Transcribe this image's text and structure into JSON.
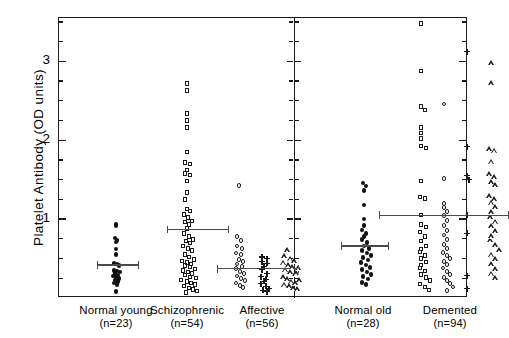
{
  "chart_data": {
    "type": "scatter",
    "title": "",
    "xlabel": "",
    "ylabel": "Platelet Antibody (OD units)",
    "ylim": [
      0,
      3.55
    ],
    "yticks_major": [
      1,
      2,
      3
    ],
    "ytick_labels": [
      "1",
      "2",
      "3"
    ],
    "yticks_minor": [
      0.25,
      0.5,
      0.75,
      1.25,
      1.5,
      1.75,
      2.25,
      2.5,
      2.75,
      3.25,
      3.5
    ],
    "grid": false,
    "legend": "none",
    "panels": [
      {
        "name": "left-panel",
        "groups": [
          {
            "label": "Normal young",
            "n_label": "(n=23)",
            "n": 23,
            "marker": "filled-circle",
            "mean": 0.42,
            "err_low": 0.21,
            "err_high": 0.63,
            "columns": [
              {
                "marker": "filled-circle",
                "values": [
                  0.93,
                  0.92,
                  0.76,
                  0.73,
                  0.71,
                  0.62,
                  0.55,
                  0.44,
                  0.43,
                  0.41,
                  0.35,
                  0.34,
                  0.33,
                  0.31,
                  0.29,
                  0.28,
                  0.26,
                  0.25,
                  0.23,
                  0.21,
                  0.19,
                  0.17,
                  0.08
                ],
                "offsets": [
                  0,
                  0,
                  -1,
                  1,
                  0,
                  0,
                  0,
                  -2,
                  1,
                  3,
                  -2,
                  1,
                  4,
                  -1,
                  2,
                  -3,
                  0,
                  3,
                  -1,
                  2,
                  -2,
                  1,
                  0
                ]
              }
            ]
          },
          {
            "label": "Schizophrenic",
            "n_label": "(n=54)",
            "n": 54,
            "marker": "open-square",
            "mean": 0.87,
            "err_low": 0.68,
            "err_high": 1.06,
            "columns": [
              {
                "marker": "open-square",
                "values": [
                  2.72,
                  2.63,
                  2.34,
                  2.25,
                  2.16,
                  1.85,
                  1.72,
                  1.7,
                  1.62,
                  1.58,
                  1.56,
                  1.48,
                  1.34,
                  1.25,
                  1.13,
                  1.1,
                  1.06,
                  1.02,
                  0.98,
                  0.96,
                  0.93,
                  0.88,
                  0.82,
                  0.78,
                  0.74,
                  0.72,
                  0.7,
                  0.66,
                  0.63,
                  0.6,
                  0.55,
                  0.52,
                  0.49,
                  0.47,
                  0.45,
                  0.43,
                  0.41,
                  0.39,
                  0.37,
                  0.35,
                  0.33,
                  0.31,
                  0.29,
                  0.27,
                  0.25,
                  0.23,
                  0.21,
                  0.19,
                  0.17,
                  0.15,
                  0.13,
                  0.11,
                  0.09,
                  0.07
                ],
                "offsets": [
                  0,
                  0,
                  0,
                  0,
                  0,
                  0,
                  -2,
                  3,
                  0,
                  -2,
                  3,
                  0,
                  0,
                  -2,
                  0,
                  3,
                  -3,
                  1,
                  5,
                  -2,
                  2,
                  0,
                  -3,
                  2,
                  6,
                  -1,
                  3,
                  -4,
                  1,
                  5,
                  -2,
                  2,
                  7,
                  -5,
                  0,
                  4,
                  -2,
                  3,
                  8,
                  -4,
                  1,
                  5,
                  -2,
                  3,
                  9,
                  -6,
                  0,
                  4,
                  8,
                  -3,
                  2,
                  6,
                  10,
                  -1
                ]
              }
            ]
          },
          {
            "label": "Affective",
            "n_label": "(n=56)",
            "n": 56,
            "marker": "mixed",
            "mean": 0.37,
            "err_low": 0.22,
            "err_high": 0.52,
            "columns": [
              {
                "marker": "open-circle",
                "values": [
                  1.43,
                  0.78,
                  0.73,
                  0.66,
                  0.63,
                  0.57,
                  0.55,
                  0.49,
                  0.46,
                  0.43,
                  0.4,
                  0.37,
                  0.34,
                  0.31,
                  0.28,
                  0.25,
                  0.22,
                  0.19,
                  0.16,
                  0.13
                ],
                "offsets": [
                  0,
                  -2,
                  2,
                  -2,
                  3,
                  -3,
                  2,
                  0,
                  4,
                  -2,
                  3,
                  -3,
                  1,
                  5,
                  -2,
                  2,
                  6,
                  -3,
                  1,
                  4
                ]
              },
              {
                "marker": "plus",
                "values": [
                  0.52,
                  0.5,
                  0.46,
                  0.44,
                  0.4,
                  0.36,
                  0.31,
                  0.27,
                  0.24,
                  0.21,
                  0.18,
                  0.15,
                  0.12,
                  0.1,
                  0.08
                ],
                "offsets": [
                  -2,
                  3,
                  -2,
                  3,
                  0,
                  -2,
                  3,
                  -3,
                  2,
                  0,
                  -3,
                  2,
                  5,
                  -1,
                  3
                ]
              },
              {
                "marker": "triangle",
                "values": [
                  0.58,
                  0.5,
                  0.47,
                  0.42,
                  0.39,
                  0.36,
                  0.33,
                  0.3,
                  0.27,
                  0.24,
                  0.21,
                  0.18,
                  0.16,
                  0.14,
                  0.12,
                  0.1,
                  0.08,
                  0.2,
                  0.29,
                  0.35,
                  0.44
                ],
                "offsets": [
                  0,
                  -3,
                  3,
                  -4,
                  1,
                  5,
                  -2,
                  3,
                  8,
                  -4,
                  0,
                  4,
                  8,
                  -3,
                  2,
                  6,
                  10,
                  12,
                  9,
                  11,
                  7
                ]
              }
            ]
          }
        ]
      },
      {
        "name": "right-panel",
        "groups": [
          {
            "label": "Normal old",
            "n_label": "(n=28)",
            "n": 28,
            "marker": "filled-circle",
            "mean": 0.66,
            "err_low": 0.45,
            "err_high": 0.87,
            "columns": [
              {
                "marker": "filled-circle",
                "values": [
                  1.46,
                  1.42,
                  1.36,
                  1.18,
                  1.0,
                  0.92,
                  0.86,
                  0.82,
                  0.78,
                  0.74,
                  0.7,
                  0.66,
                  0.63,
                  0.6,
                  0.57,
                  0.54,
                  0.51,
                  0.48,
                  0.45,
                  0.42,
                  0.39,
                  0.36,
                  0.33,
                  0.3,
                  0.27,
                  0.24,
                  0.2,
                  0.17
                ],
                "offsets": [
                  -1,
                  2,
                  0,
                  0,
                  0,
                  0,
                  -2,
                  2,
                  0,
                  -2,
                  3,
                  0,
                  5,
                  -2,
                  3,
                  7,
                  -1,
                  4,
                  -3,
                  2,
                  6,
                  -2,
                  3,
                  7,
                  -1,
                  4,
                  -2,
                  2
                ]
              }
            ]
          },
          {
            "label": "Demented",
            "n_label": "(n=94)",
            "n": 94,
            "marker": "mixed",
            "mean": 1.05,
            "err_low": 0.43,
            "err_high": 1.72,
            "columns": [
              {
                "marker": "open-square",
                "values": [
                  3.48,
                  2.88,
                  2.43,
                  2.38,
                  2.16,
                  2.09,
                  2.02,
                  1.93,
                  1.9,
                  1.48,
                  1.28,
                  1.26,
                  1.05,
                  0.93,
                  0.9,
                  0.84,
                  0.78,
                  0.72,
                  0.66,
                  0.62,
                  0.58,
                  0.54,
                  0.5,
                  0.46,
                  0.42,
                  0.38,
                  0.34,
                  0.3,
                  0.26,
                  0.22,
                  0.18,
                  0.14,
                  0.1
                ],
                "offsets": [
                  0,
                  0,
                  0,
                  4,
                  0,
                  0,
                  0,
                  0,
                  5,
                  0,
                  -1,
                  4,
                  0,
                  0,
                  5,
                  -1,
                  4,
                  0,
                  5,
                  0,
                  -1,
                  4,
                  0,
                  5,
                  0,
                  -1,
                  4,
                  0,
                  5,
                  9,
                  -1,
                  4,
                  8
                ]
              },
              {
                "marker": "open-circle",
                "values": [
                  2.46,
                  1.52,
                  1.2,
                  1.15,
                  1.1,
                  1.05,
                  0.98,
                  0.92,
                  0.86,
                  0.8,
                  0.74,
                  0.68,
                  0.63,
                  0.58,
                  0.54,
                  0.5,
                  0.46,
                  0.42,
                  0.38,
                  0.34,
                  0.3,
                  0.26,
                  0.22,
                  0.18,
                  0.14,
                  0.1
                ],
                "offsets": [
                  0,
                  0,
                  0,
                  0,
                  3,
                  0,
                  3,
                  0,
                  3,
                  0,
                  3,
                  0,
                  3,
                  -1,
                  3,
                  6,
                  0,
                  3,
                  -1,
                  3,
                  6,
                  0,
                  3,
                  6,
                  9,
                  3
                ]
              },
              {
                "marker": "plus",
                "values": [
                  3.12,
                  1.92,
                  1.55,
                  1.5,
                  1.05,
                  0.82,
                  0.28,
                  0.12
                ],
                "offsets": [
                  0,
                  0,
                  0,
                  2,
                  0,
                  0,
                  0,
                  0
                ]
              },
              {
                "marker": "triangle",
                "values": [
                  2.95,
                  2.7,
                  1.86,
                  1.84,
                  1.7,
                  1.54,
                  1.5,
                  1.44,
                  1.4,
                  1.26,
                  1.22,
                  1.18,
                  1.12,
                  1.06,
                  1.0,
                  0.94,
                  0.88,
                  0.82,
                  0.76,
                  0.7,
                  0.64,
                  0.58,
                  0.52,
                  0.46,
                  0.4,
                  0.34,
                  0.28,
                  0.22
                ],
                "offsets": [
                  0,
                  0,
                  -2,
                  3,
                  0,
                  -2,
                  3,
                  0,
                  4,
                  -2,
                  3,
                  0,
                  4,
                  0,
                  -1,
                  4,
                  0,
                  4,
                  0,
                  -1,
                  4,
                  8,
                  0,
                  4,
                  0,
                  4,
                  0,
                  4
                ]
              }
            ]
          }
        ]
      }
    ]
  }
}
